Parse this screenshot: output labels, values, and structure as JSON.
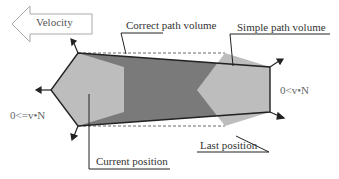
{
  "diagram": {
    "velocity_label": "Velocity",
    "correct_path_label": "Correct path volume",
    "simple_path_label": "Simple path volume",
    "current_position_label": "Current position",
    "last_position_label": "Last position",
    "left_condition": "0<=v•N",
    "right_condition": "0<v•N",
    "colors": {
      "light_poly": "#bdbdbd",
      "dark_path": "#7a7a7a",
      "stroke": "#222222",
      "text": "#333333"
    }
  }
}
